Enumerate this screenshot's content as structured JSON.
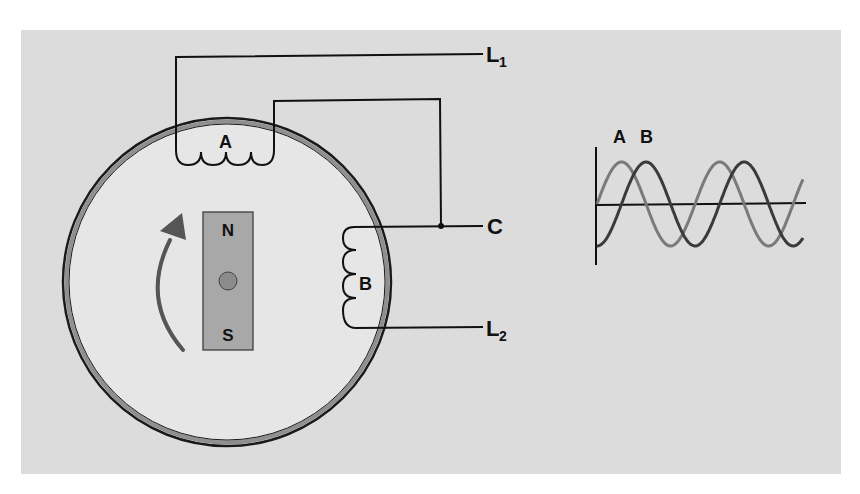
{
  "diagram": {
    "colors": {
      "page": "#ffffff",
      "panel": "#dcdcdc",
      "stator_fill": "#e6e6e6",
      "stator_ring": "#8a8a8a",
      "wire": "#111111",
      "magnet": "#a8a8a8",
      "magnet_pivot": "#8a8a8a",
      "arrow": "#555555",
      "wave_a": "#7a7a7a",
      "wave_b": "#3a3a3a"
    },
    "coil_a": {
      "label": "A"
    },
    "coil_b": {
      "label": "B"
    },
    "terminals": {
      "l1": {
        "label": "L",
        "subscript": "1"
      },
      "c": {
        "label": "C"
      },
      "l2": {
        "label": "L",
        "subscript": "2"
      }
    },
    "magnet": {
      "north": "N",
      "south": "S"
    },
    "rotation": {
      "direction": "clockwise"
    },
    "waveform": {
      "label_a": "A",
      "label_b": "B",
      "phase_shift_deg": 90
    }
  },
  "chart_data": {
    "type": "line",
    "title": "",
    "xlabel": "",
    "ylabel": "",
    "series": [
      {
        "name": "A",
        "shape": "sine",
        "phase_deg": 0,
        "cycles": 2.1
      },
      {
        "name": "B",
        "shape": "sine",
        "phase_deg": -90,
        "cycles": 2.1
      }
    ],
    "legend": [
      "A",
      "B"
    ],
    "grid": false
  }
}
